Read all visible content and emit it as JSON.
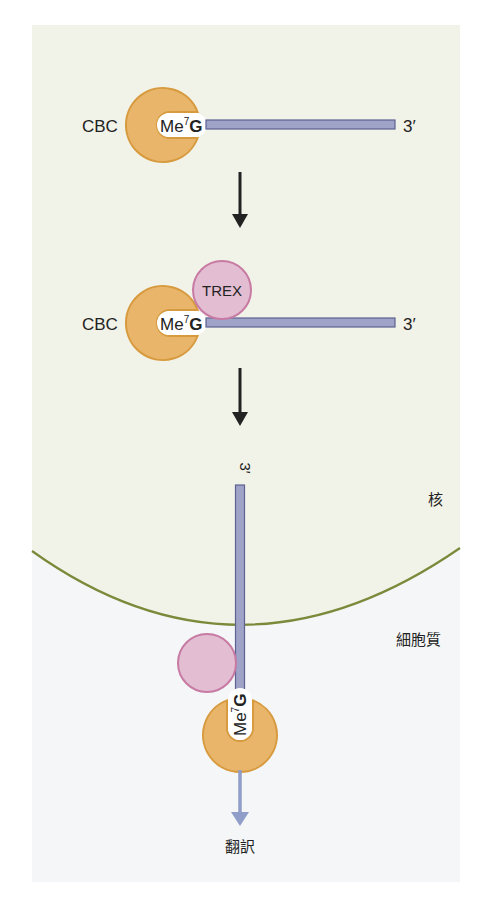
{
  "colors": {
    "nucleus_bg": "#f2f3e8",
    "cytoplasm_bg": "#f4f6f8",
    "membrane": "#7a8a3a",
    "cbc_fill": "#e8b56a",
    "cbc_stroke": "#d79a3e",
    "trex_fill": "#e3bed3",
    "trex_stroke": "#c77aa3",
    "rna_fill": "#9fa3c8",
    "rna_stroke": "#5d6290",
    "arrow_black": "#222222",
    "arrow_blue": "#8f9dc8"
  },
  "step1": {
    "cbc_label": "CBC",
    "cap_label_base": "Me",
    "cap_label_sup": "7",
    "cap_label_end": "G",
    "three_prime": "3′"
  },
  "step2": {
    "cbc_label": "CBC",
    "trex_label": "TREX",
    "cap_label_base": "Me",
    "cap_label_sup": "7",
    "cap_label_end": "G",
    "three_prime": "3′"
  },
  "step3": {
    "three_prime": "3′",
    "cap_label_base": "Me",
    "cap_label_sup": "7",
    "cap_label_end": "G"
  },
  "compartments": {
    "nucleus": "核",
    "cytoplasm": "細胞質"
  },
  "outcome": {
    "label": "翻訳"
  }
}
